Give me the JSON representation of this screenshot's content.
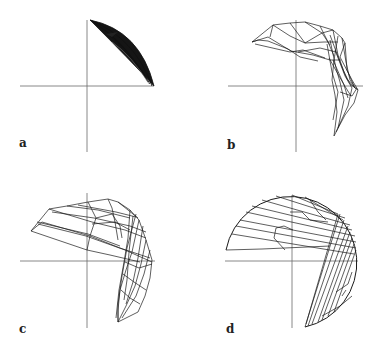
{
  "figure": {
    "panels": [
      {
        "id": "a",
        "label": "a",
        "description": "dense cluster of curves in upper-right quadrant along a circular arc"
      },
      {
        "id": "b",
        "label": "b",
        "description": "wireframe polygon sweep spanning upper-left to lower-right quadrant"
      },
      {
        "id": "c",
        "label": "c",
        "description": "wider wireframe polygon sweep spanning upper-left to lower-right quadrant"
      },
      {
        "id": "d",
        "label": "d",
        "description": "wireframe filling most of a circle except lower-left quadrant"
      }
    ],
    "colors": {
      "background": "#ffffff",
      "axis": "#6a6a6a",
      "lines": "#1a1a1a"
    }
  }
}
